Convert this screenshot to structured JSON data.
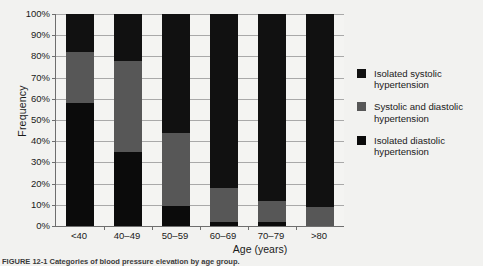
{
  "chart_data": {
    "type": "bar",
    "subtype": "stacked-percentage",
    "title": "",
    "xlabel": "Age (years)",
    "ylabel": "Frequency",
    "categories": [
      "<40",
      "40–49",
      "50–59",
      "60–69",
      "70–79",
      ">80"
    ],
    "ylim": [
      0,
      100
    ],
    "ytick_labels": [
      "0%",
      "10%",
      "20%",
      "30%",
      "40%",
      "50%",
      "60%",
      "70%",
      "80%",
      "90%",
      "100%"
    ],
    "ytick_values": [
      0,
      10,
      20,
      30,
      40,
      50,
      60,
      70,
      80,
      90,
      100
    ],
    "grid": "horizontal",
    "legend_position": "right",
    "series": [
      {
        "name": "Isolated diastolic hypertension",
        "color": "#0b0b0b",
        "values": [
          58,
          35,
          9.5,
          2,
          2,
          0
        ]
      },
      {
        "name": "Systolic and diastolic hypertension",
        "color": "#575757",
        "values": [
          24,
          43,
          34.5,
          16,
          10,
          9
        ]
      },
      {
        "name": "Isolated systolic hypertension",
        "color": "#111111",
        "values": [
          18,
          22,
          56,
          82,
          88,
          91
        ]
      }
    ]
  },
  "legend": {
    "items": [
      {
        "label_line1": "Isolated systolic",
        "label_line2": "hypertension",
        "swatch": "sw-sys"
      },
      {
        "label_line1": "Systolic and diastolic",
        "label_line2": "hypertension",
        "swatch": "sw-mixed"
      },
      {
        "label_line1": "Isolated diastolic",
        "label_line2": "hypertension",
        "swatch": "sw-dia"
      }
    ]
  },
  "caption": {
    "text": "FIGURE 12-1   Categories of blood pressure elevation by age group."
  }
}
